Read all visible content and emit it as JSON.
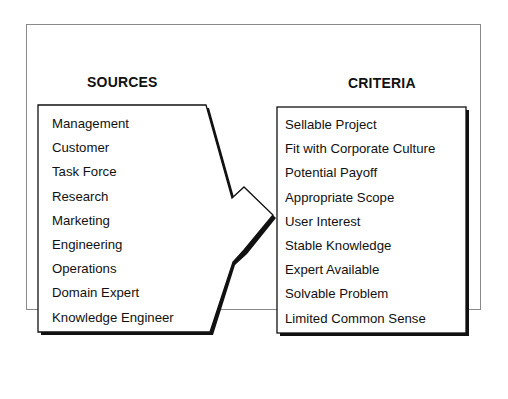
{
  "diagram": {
    "sources": {
      "title": "SOURCES",
      "items": [
        "Management",
        "Customer",
        "Task Force",
        "Research",
        "Marketing",
        "Engineering",
        "Operations",
        "Domain Expert",
        "Knowledge Engineer"
      ]
    },
    "criteria": {
      "title": "CRITERIA",
      "items": [
        "Sellable Project",
        "Fit with Corporate Culture",
        "Potential Payoff",
        "Appropriate Scope",
        "User Interest",
        "Stable Knowledge",
        "Expert Available",
        "Solvable Problem",
        "Limited Common Sense"
      ]
    },
    "colors": {
      "stroke": "#111111",
      "frame": "#8a8a8a",
      "background": "#ffffff"
    }
  }
}
